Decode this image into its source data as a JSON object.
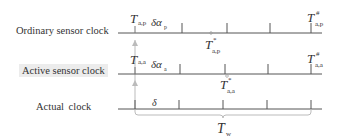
{
  "diagram": {
    "rows": [
      {
        "label": "Ordinary sensor clock",
        "start": {
          "symbol": "T",
          "sub": "a,p"
        },
        "drift": {
          "symbol": "δα",
          "sub": "p"
        },
        "mid": {
          "symbol": "T",
          "sup": "*",
          "sub": "a,p"
        },
        "end": {
          "symbol": "T",
          "sup": "#",
          "sub": "a,p"
        }
      },
      {
        "label": "Active sensor clock",
        "start": {
          "symbol": "T",
          "sub": "a,a"
        },
        "drift": {
          "symbol": "δα",
          "sub": "a"
        },
        "mid": {
          "symbol": "T",
          "sup": "*",
          "sub": "a,a"
        },
        "end": {
          "symbol": "T",
          "sup": "#",
          "sub": "a,a"
        }
      },
      {
        "label": "Actual  clock",
        "interval": {
          "symbol": "δ"
        },
        "window": {
          "symbol": "T",
          "sub": "w"
        }
      }
    ],
    "colors": {
      "line": "#555555",
      "arrow": "#bbbbbb",
      "bracket": "#bbbbbb",
      "label_bg": "#ececec"
    }
  }
}
